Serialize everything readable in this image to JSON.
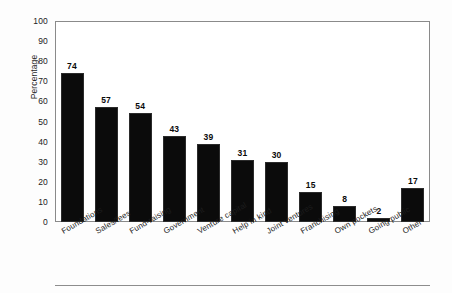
{
  "figure": {
    "background_color": "#fdfdfd",
    "plot_background_color": "#ffffff",
    "frame_color": "#8a8a8a",
    "bar_color": "#0b0b0b"
  },
  "chart_data": {
    "type": "bar",
    "title": "",
    "subtitle": "",
    "xlabel": "",
    "ylabel": "Percentage",
    "ylim": [
      0,
      100
    ],
    "ytick_labels": [
      "100",
      "90",
      "80",
      "70",
      "60",
      "50",
      "40",
      "30",
      "20",
      "10",
      "0"
    ],
    "ytick_values": [
      100,
      90,
      80,
      70,
      60,
      50,
      40,
      30,
      20,
      10,
      0
    ],
    "grid": false,
    "legend": false,
    "legend_position": "none",
    "value_labels_shown": true,
    "xtick_rotation_degrees": -30,
    "categories": [
      "Foundations",
      "Sales/fees",
      "Fund-raising",
      "Government",
      "Venture capital",
      "Help in kind",
      "Joint ventures",
      "Franchising",
      "Own pockets",
      "Going public",
      "Other"
    ],
    "values": [
      74,
      57,
      54,
      43,
      39,
      31,
      30,
      15,
      8,
      2,
      17
    ]
  },
  "bottom_rule": {
    "present": true
  }
}
